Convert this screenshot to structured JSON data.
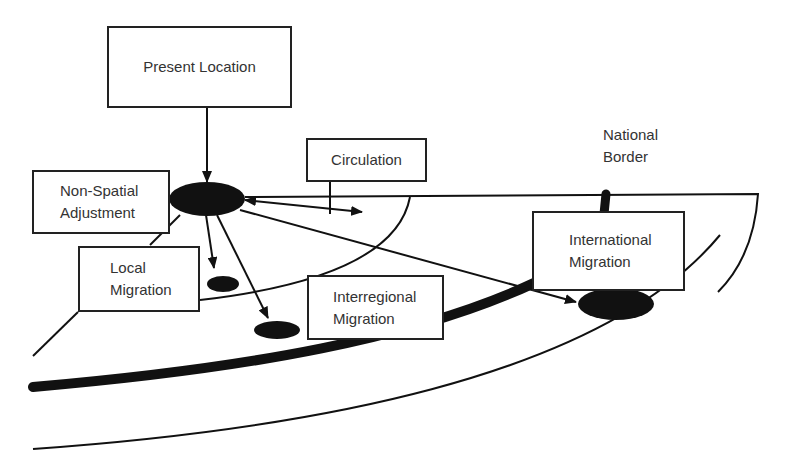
{
  "diagram": {
    "nodes": {
      "present_location": "Present Location",
      "circulation": "Circulation",
      "non_spatial_line1": "Non-Spatial",
      "non_spatial_line2": "Adjustment",
      "local_line1": "Local",
      "local_line2": "Migration",
      "interregional_line1": "Interregional",
      "interregional_line2": "Migration",
      "international_line1": "International",
      "international_line2": "Migration"
    },
    "labels": {
      "national_line1": "National",
      "national_line2": "Border"
    },
    "colors": {
      "stroke": "#111111",
      "text": "#333333",
      "background": "#ffffff"
    }
  }
}
